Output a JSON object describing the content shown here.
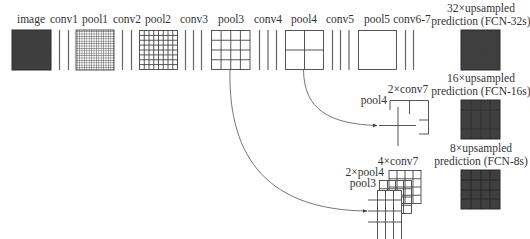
{
  "colors": {
    "line": "#555555",
    "dark_fill": "#3f3f3f",
    "text": "#333333",
    "background": "#ffffff"
  },
  "stages": [
    {
      "label": "image",
      "kind": "dark-square"
    },
    {
      "label": "conv1",
      "kind": "bars",
      "count": 2
    },
    {
      "label": "pool1",
      "kind": "grid",
      "divisions": 16
    },
    {
      "label": "conv2",
      "kind": "bars",
      "count": 2
    },
    {
      "label": "pool2",
      "kind": "grid",
      "divisions": 8
    },
    {
      "label": "conv3",
      "kind": "bars",
      "count": 3
    },
    {
      "label": "pool3",
      "kind": "grid",
      "divisions": 4
    },
    {
      "label": "conv4",
      "kind": "bars",
      "count": 3
    },
    {
      "label": "pool4",
      "kind": "grid",
      "divisions": 2
    },
    {
      "label": "conv5",
      "kind": "bars",
      "count": 3
    },
    {
      "label": "pool5",
      "kind": "grid",
      "divisions": 1
    },
    {
      "label": "conv6-7",
      "kind": "bars",
      "count": 2
    }
  ],
  "outputs": [
    {
      "line1": "32×upsampled",
      "line2": "prediction (FCN-32s)"
    },
    {
      "line1": "16×upsampled",
      "line2": "prediction (FCN-16s)"
    },
    {
      "line1": "8×upsampled",
      "line2": "prediction (FCN-8s)"
    }
  ],
  "fusion16": {
    "back_label": "2×conv7",
    "front_label": "pool4"
  },
  "fusion8": {
    "back_label": "4×conv7",
    "middle_label": "2×pool4",
    "front_label": "pool3"
  },
  "arrows": [
    {
      "from": "pool4",
      "to": "fusion16"
    },
    {
      "from": "pool3",
      "to": "fusion8"
    }
  ]
}
